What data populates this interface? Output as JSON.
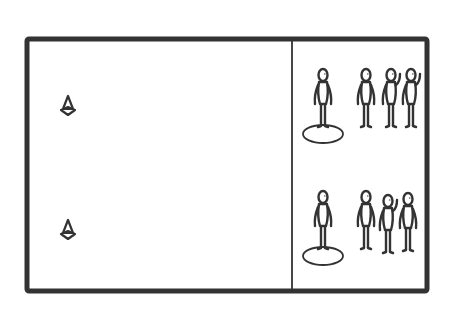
{
  "diagram": {
    "type": "sports-drill-court",
    "colors": {
      "line": "#333333",
      "background": "#ffffff"
    },
    "court": {
      "x": 27,
      "y": 39,
      "width": 400,
      "height": 252
    },
    "divider_x": 292,
    "cones": [
      {
        "id": "cone-top",
        "x": 68,
        "y": 107
      },
      {
        "id": "cone-bottom",
        "x": 68,
        "y": 231
      }
    ],
    "groups": [
      {
        "id": "group-top",
        "leader": {
          "x": 323,
          "y": 100,
          "marker": "circle"
        },
        "players": [
          {
            "x": 366,
            "y": 100
          },
          {
            "x": 391,
            "y": 100,
            "wave": true
          },
          {
            "x": 411,
            "y": 100,
            "wave": true
          }
        ]
      },
      {
        "id": "group-bottom",
        "leader": {
          "x": 323,
          "y": 222,
          "marker": "circle"
        },
        "players": [
          {
            "x": 366,
            "y": 222
          },
          {
            "x": 388,
            "y": 226,
            "wave": true
          },
          {
            "x": 408,
            "y": 224
          }
        ]
      }
    ]
  }
}
